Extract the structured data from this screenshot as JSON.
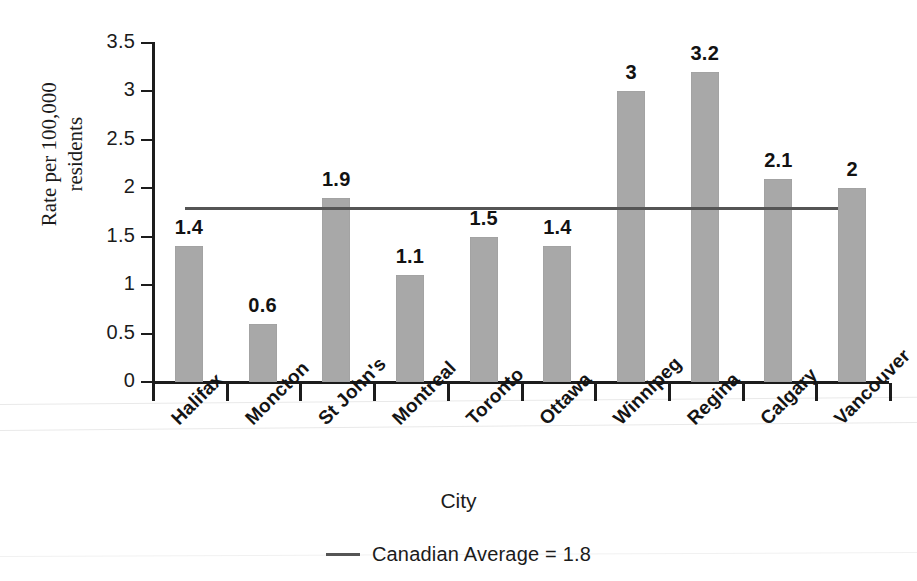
{
  "chart_data": {
    "type": "bar",
    "title": "",
    "xlabel": "City",
    "ylabel": "Rate per 100,000 residents",
    "ylabel_line1": "Rate per 100,000",
    "ylabel_line2": "residents",
    "categories": [
      "Halifax",
      "Moncton",
      "St John's",
      "Montreal",
      "Toronto",
      "Ottawa",
      "Winnipeg",
      "Regina",
      "Calgary",
      "Vancouver"
    ],
    "values": [
      1.4,
      0.6,
      1.9,
      1.1,
      1.5,
      1.4,
      3,
      3.2,
      2.1,
      2
    ],
    "value_labels": [
      "1.4",
      "0.6",
      "1.9",
      "1.1",
      "1.5",
      "1.4",
      "3",
      "3.2",
      "2.1",
      "2"
    ],
    "ylim": [
      0,
      3.5
    ],
    "ytick_values": [
      0,
      0.5,
      1,
      1.5,
      2,
      2.5,
      3,
      3.5
    ],
    "ytick_labels": [
      "0",
      "0.5",
      "1",
      "1.5",
      "2",
      "2.5",
      "3",
      "3.5"
    ],
    "grid": false,
    "legend_position": "bottom-center",
    "bar_color": "#a8a8a8",
    "reference_line": {
      "label": "Canadian Average = 1.8",
      "value": 1.8,
      "color": "#555555"
    }
  },
  "legend": {
    "entries": [
      {
        "label": "Canadian Average = 1.8",
        "swatch": "line-swatch",
        "color": "#555555"
      }
    ]
  }
}
